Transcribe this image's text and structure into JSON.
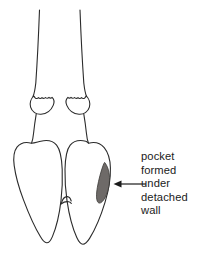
{
  "figure": {
    "name": "bovine-hoof-claw-diagram",
    "view": "plantar view of a cloven hoof showing two claws, dewclaws and a shaded lesion",
    "background_color": "#ffffff",
    "stroke_color": "#2b2b2b",
    "fill_color": "#ffffff",
    "stroke_width": 1.1
  },
  "callout": {
    "lines": [
      "pocket",
      "formed",
      "under",
      "detached",
      "wall"
    ],
    "full_text": "pocket formed under detached wall",
    "text_color": "#1b1b1b",
    "font_size_px": 11.2,
    "line_height_px": 13.6
  },
  "arrow": {
    "label": "leader-arrow",
    "direction": "left",
    "color": "#1b1b1b",
    "start_x": 146,
    "start_y": 184,
    "end_x": 114,
    "end_y": 184
  },
  "pocket_shape": {
    "label": "shaded-pocket-lesion",
    "fill_color": "#6e6a68",
    "stroke_color": "#3a3836",
    "center_x": 104,
    "center_y": 182,
    "width": 14,
    "height": 40
  },
  "parts": [
    {
      "id": "left-metacarpal-line",
      "label": "left leg shaft line"
    },
    {
      "id": "right-metacarpal-line",
      "label": "right leg shaft line"
    },
    {
      "id": "left-dewclaw",
      "label": "left dewclaw"
    },
    {
      "id": "right-dewclaw",
      "label": "right dewclaw"
    },
    {
      "id": "left-claw",
      "label": "left claw (lateral)"
    },
    {
      "id": "right-claw",
      "label": "right claw (medial)"
    },
    {
      "id": "interdigital-bridge",
      "label": "interdigital cleft bridge"
    }
  ]
}
